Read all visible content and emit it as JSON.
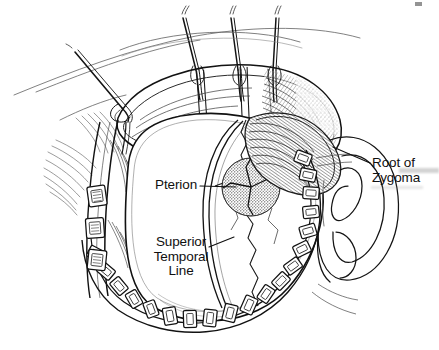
{
  "figure": {
    "kind": "surgical-line-illustration",
    "width": 439,
    "height": 350,
    "background_color": "#ffffff",
    "ink_color": "#101010",
    "paper_tone": "#ffffff"
  },
  "labels": {
    "pterion": "Pterion",
    "superior_temporal_line": "Superior\nTemporal\nLine",
    "superior_temporal_line_lines": [
      "Superior",
      "Temporal",
      "Line"
    ],
    "root_of_zygoma": "Root of\nZygoma",
    "root_of_zygoma_lines": [
      "Root of",
      "Zygoma"
    ]
  },
  "leaders": {
    "pterion": {
      "from_x": 200,
      "from_y": 186,
      "to_x": 236,
      "to_y": 187
    },
    "superior_temporal_line": {
      "from_x": 209,
      "from_y": 247,
      "to_x": 234,
      "to_y": 237
    },
    "root_of_zygoma": {
      "from_x": 370,
      "from_y": 163,
      "to_x": 333,
      "to_y": 147
    }
  },
  "anatomy": {
    "landmarks": [
      {
        "name": "pterion",
        "note": "stippled circular zone at the junction of frontal, parietal, temporal and sphenoid bones"
      },
      {
        "name": "superior-temporal-line",
        "note": "curved ridge sweeping over the lateral skull surface"
      },
      {
        "name": "root-of-zygoma",
        "note": "bony root anterior to the external ear"
      },
      {
        "name": "external-ear",
        "note": "auricle drawn in outline at the right of the field"
      },
      {
        "name": "temporalis-muscle",
        "note": "hatched muscle mass beneath the reflected scalp"
      },
      {
        "name": "scalp-flap",
        "note": "anteriorly reflected myocutaneous flap held by traction sutures"
      }
    ],
    "instruments": [
      {
        "name": "raney-scalp-clips",
        "count_visible": 22,
        "note": "rectangular clips lining the cut scalp edge around the exposure"
      },
      {
        "name": "traction-sutures",
        "count_visible": 3,
        "note": "sutures on hooks retracting the flap superiorly"
      },
      {
        "name": "fishhook-retractor",
        "count_visible": 1,
        "note": "hook with elastic band at the upper-left of the flap"
      }
    ]
  },
  "colors": {
    "ink": "#101010",
    "hatch": "#2b2b2b",
    "stipple": "#3a3a3a",
    "light_line": "#767676",
    "smudge": "#8c8c8c"
  }
}
